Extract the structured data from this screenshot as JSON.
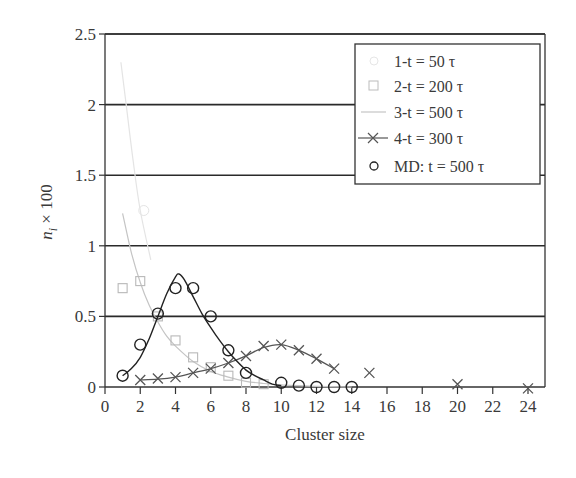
{
  "chart_data": {
    "type": "line",
    "title": "",
    "xlabel": "Cluster size",
    "ylabel_main": "n",
    "ylabel_sub": "i",
    "ylabel_suffix": " × 100",
    "ylabel": "n_i × 100",
    "xlim": [
      0,
      25
    ],
    "ylim": [
      0,
      2.5
    ],
    "xticks": [
      0,
      2,
      4,
      6,
      8,
      10,
      12,
      14,
      16,
      18,
      20,
      22,
      24
    ],
    "yticks": [
      0,
      0.5,
      1,
      1.5,
      2,
      2.5
    ],
    "ytick_labels": [
      "0",
      "0.5",
      "1",
      "1.5",
      "2",
      "2.5"
    ],
    "grid": "horizontal",
    "legend_position": "upper right",
    "series": [
      {
        "name": "1-t = 50 τ",
        "style": "faint-line-circle",
        "color": "#e4e4e4",
        "x": [
          1,
          2
        ],
        "y": [
          2.2,
          1.25
        ]
      },
      {
        "name": "2-t = 200 τ",
        "style": "square-markers",
        "color": "#b8b8b8",
        "x": [
          1,
          2,
          3,
          4,
          5,
          6,
          7,
          8,
          9
        ],
        "y": [
          0.7,
          0.75,
          0.5,
          0.33,
          0.21,
          0.14,
          0.08,
          0.03,
          0.02
        ]
      },
      {
        "name": "3-t = 500 τ",
        "style": "line",
        "color": "#c4c4c4",
        "x": [
          1,
          1.5,
          2,
          2.5,
          3,
          3.5,
          4,
          5,
          6,
          7,
          8,
          9,
          10,
          12,
          14
        ],
        "y": [
          1.23,
          0.95,
          0.74,
          0.58,
          0.46,
          0.36,
          0.29,
          0.18,
          0.11,
          0.07,
          0.04,
          0.025,
          0.015,
          0.005,
          0.0
        ]
      },
      {
        "name": "4-t = 300 τ",
        "style": "line-x-markers",
        "color": "#555555",
        "x": [
          2,
          3,
          4,
          5,
          6,
          7,
          8,
          9,
          10,
          11,
          12,
          13,
          15,
          20,
          24
        ],
        "y": [
          0.05,
          0.06,
          0.07,
          0.1,
          0.13,
          0.17,
          0.22,
          0.29,
          0.3,
          0.26,
          0.2,
          0.13,
          0.1,
          0.02,
          -0.01
        ],
        "line_x": [
          2,
          3,
          4,
          5,
          6,
          7,
          8,
          9,
          10,
          11,
          12,
          13
        ],
        "line_y": [
          0.05,
          0.055,
          0.07,
          0.1,
          0.13,
          0.17,
          0.22,
          0.28,
          0.3,
          0.26,
          0.2,
          0.13
        ]
      },
      {
        "name": "MD: t = 500 τ",
        "style": "circle-markers",
        "color": "#222222",
        "x": [
          1,
          2,
          3,
          4,
          5,
          6,
          7,
          8,
          10,
          11,
          12,
          13,
          14
        ],
        "y": [
          0.08,
          0.3,
          0.52,
          0.7,
          0.7,
          0.5,
          0.26,
          0.1,
          0.03,
          0.01,
          0.0,
          0.0,
          0.0
        ]
      }
    ],
    "fit_curve": {
      "name": "MD fit",
      "color": "#222222",
      "x": [
        1,
        1.5,
        2,
        2.5,
        3,
        3.5,
        4,
        4.2,
        4.5,
        5,
        5.5,
        6,
        6.5,
        7,
        7.5,
        8,
        8.5,
        9,
        9.5,
        10
      ],
      "y": [
        0.08,
        0.13,
        0.21,
        0.34,
        0.5,
        0.66,
        0.78,
        0.8,
        0.76,
        0.64,
        0.52,
        0.42,
        0.33,
        0.25,
        0.18,
        0.12,
        0.08,
        0.05,
        0.02,
        0.01
      ]
    }
  },
  "legend": {
    "items": [
      {
        "label": "1-t = 50 τ"
      },
      {
        "label": "2-t = 200 τ"
      },
      {
        "label": "3-t = 500 τ"
      },
      {
        "label": "4-t = 300 τ"
      },
      {
        "label": "MD: t = 500 τ"
      }
    ]
  }
}
